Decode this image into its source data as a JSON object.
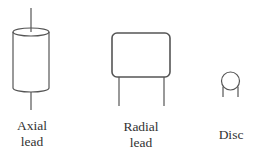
{
  "diagram": {
    "stroke_color": "#555555",
    "components": [
      {
        "id": "axial",
        "name": "Axial lead",
        "label_lines": [
          "Axial",
          "lead"
        ]
      },
      {
        "id": "radial",
        "name": "Radial lead",
        "label_lines": [
          "Radial",
          "lead"
        ]
      },
      {
        "id": "disc",
        "name": "Disc",
        "label_lines": [
          "Disc"
        ]
      }
    ]
  }
}
